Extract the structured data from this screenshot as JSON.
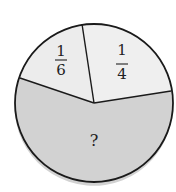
{
  "diagram": {
    "type": "pie",
    "colors": {
      "light_fill": "#ececec",
      "dark_fill": "#d2d2d2",
      "stroke": "#1a1a1a",
      "background": "#ffffff"
    },
    "slices": [
      {
        "id": "sixth",
        "label_num": "1",
        "label_den": "6",
        "fraction": "1/6"
      },
      {
        "id": "quarter",
        "label_num": "1",
        "label_den": "4",
        "fraction": "1/4"
      },
      {
        "id": "unknown",
        "label": "?"
      }
    ]
  }
}
